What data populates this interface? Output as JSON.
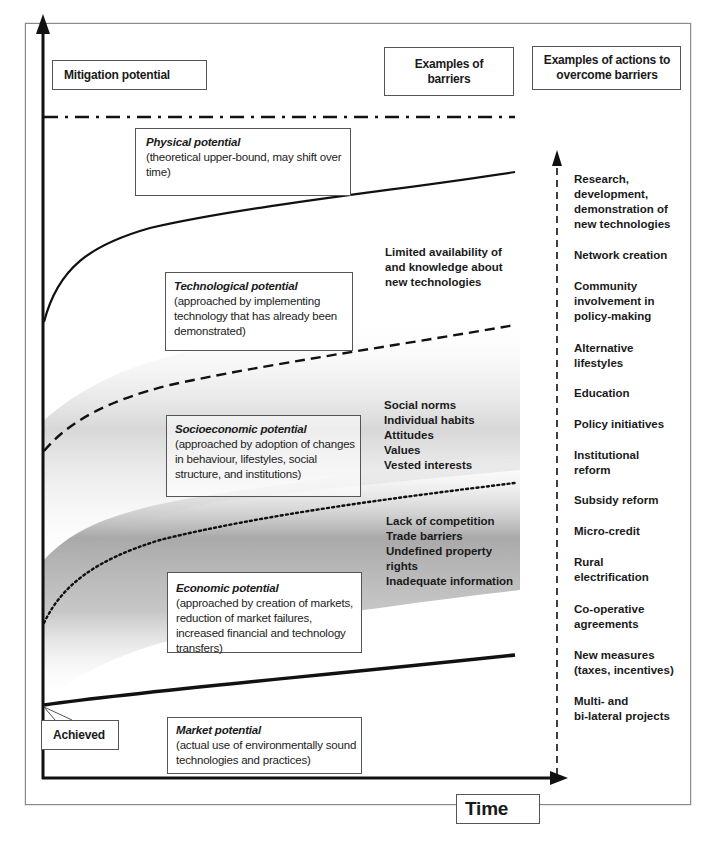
{
  "axes": {
    "y_label": "Mitigation potential",
    "x_label": "Time"
  },
  "headers": {
    "barriers": "Examples of barriers",
    "actions": "Examples of actions to overcome barriers"
  },
  "potentials": [
    {
      "id": "physical",
      "title": "Physical potential",
      "description": "(theoretical upper-bound, may shift over time)",
      "line_style": "dash-dot"
    },
    {
      "id": "technological",
      "title": "Technological potential",
      "description": "(approached by implementing technology that has already been demonstrated)",
      "line_style": "solid"
    },
    {
      "id": "socioeconomic",
      "title": "Socioeconomic potential",
      "description": "(approached by adoption of changes in behaviour, lifestyles, social structure, and institutions)",
      "line_style": "dashed"
    },
    {
      "id": "economic",
      "title": "Economic potential",
      "description": "(approached by creation of markets, reduction of market failures, increased financial and technology transfers)",
      "line_style": "dotted"
    },
    {
      "id": "market",
      "title": "Market potential",
      "description": "(actual use of environmentally sound technologies and practices)",
      "line_style": "solid-thick"
    }
  ],
  "achieved_label": "Achieved",
  "barriers": [
    {
      "group": "technological",
      "lines": [
        "Limited availability of",
        "and knowledge about",
        "new technologies"
      ]
    },
    {
      "group": "socioeconomic",
      "lines": [
        "Social norms",
        "Individual habits",
        "Attitudes",
        "Values",
        "Vested interests"
      ]
    },
    {
      "group": "economic",
      "lines": [
        "Lack of competition",
        "Trade barriers",
        "Undefined property",
        "rights",
        "Inadequate information"
      ]
    }
  ],
  "actions": [
    {
      "lines": [
        "Research,",
        "development,",
        "demonstration of",
        "new technologies"
      ]
    },
    {
      "lines": [
        "Network creation"
      ]
    },
    {
      "lines": [
        "Community",
        "involvement in",
        "policy-making"
      ]
    },
    {
      "lines": [
        "Alternative",
        "lifestyles"
      ]
    },
    {
      "lines": [
        "Education"
      ]
    },
    {
      "lines": [
        "Policy initiatives"
      ]
    },
    {
      "lines": [
        "Institutional",
        "reform"
      ]
    },
    {
      "lines": [
        "Subsidy reform"
      ]
    },
    {
      "lines": [
        "Micro-credit"
      ]
    },
    {
      "lines": [
        "Rural",
        "electrification"
      ]
    },
    {
      "lines": [
        "Co-operative",
        "agreements"
      ]
    },
    {
      "lines": [
        "New measures",
        "(taxes, incentives)"
      ]
    },
    {
      "lines": [
        "Multi- and",
        "bi-lateral projects"
      ]
    }
  ],
  "colors": {
    "line": "#111111",
    "box_border": "#555555",
    "shading_dark": "#9a9a9a",
    "shading_light": "#ffffff",
    "frame": "#8a8a8a"
  }
}
